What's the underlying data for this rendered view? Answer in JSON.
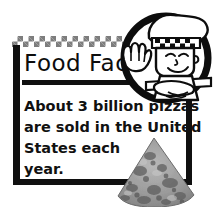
{
  "card": {
    "title": "Food Facts",
    "body_lines": [
      "About 3 billion pizzas",
      "are sold in the United",
      "States each",
      "year."
    ],
    "body_text": "About 3 billion pizzas are sold in the United States each year.",
    "icons": {
      "chef": "chef-cartoon-icon",
      "pizza": "pizza-slice-photo",
      "checker": "checkered-border-pattern"
    },
    "colors": {
      "frame": "#101010",
      "text": "#111111",
      "checker": "#7d7d7d",
      "background": "#ffffff",
      "pizza_crust": "#9a9a9a",
      "pizza_topping": "#6e6e6e"
    }
  }
}
